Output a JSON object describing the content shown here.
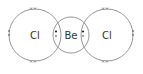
{
  "diagram": {
    "atoms": [
      {
        "symbol": "Cl",
        "cx": 35,
        "cy": 35,
        "r": 26
      },
      {
        "symbol": "Be",
        "cx": 71,
        "cy": 35,
        "r": 18
      },
      {
        "symbol": "Cl",
        "cx": 107,
        "cy": 35,
        "r": 26
      }
    ],
    "lone_pairs": "crosses (x x) on top, bottom and outer side of each Cl",
    "bond_pairs": "dot + cross in each Cl–Be overlap",
    "colors": {
      "stroke": "#8a8a8a",
      "text": "#333333"
    }
  }
}
